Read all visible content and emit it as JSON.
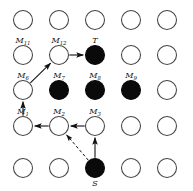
{
  "figure": {
    "width": 193,
    "height": 191,
    "background": "#ffffff",
    "node_stroke": "#444444",
    "filled_color": "#0a0a0a",
    "open_color": "#ffffff",
    "edge_color": "#111111"
  },
  "grid": {
    "columns": 5,
    "rows": 5,
    "col_x": [
      23,
      59,
      95,
      131,
      167
    ],
    "row_y": [
      20,
      55,
      90,
      126,
      168
    ],
    "radius": 9.5
  },
  "nodes": [
    {
      "id": "r1c1",
      "col": 0,
      "row": 0,
      "filled": false,
      "label": "",
      "sub": "",
      "label_pos": "none"
    },
    {
      "id": "r1c2",
      "col": 1,
      "row": 0,
      "filled": false,
      "label": "",
      "sub": "",
      "label_pos": "none"
    },
    {
      "id": "r1c3",
      "col": 2,
      "row": 0,
      "filled": false,
      "label": "",
      "sub": "",
      "label_pos": "none"
    },
    {
      "id": "r1c4",
      "col": 3,
      "row": 0,
      "filled": false,
      "label": "",
      "sub": "",
      "label_pos": "none"
    },
    {
      "id": "r1c5",
      "col": 4,
      "row": 0,
      "filled": false,
      "label": "",
      "sub": "",
      "label_pos": "none"
    },
    {
      "id": "M11",
      "col": 0,
      "row": 1,
      "filled": false,
      "label": "M",
      "sub": "11",
      "label_pos": "above"
    },
    {
      "id": "M12",
      "col": 1,
      "row": 1,
      "filled": false,
      "label": "M",
      "sub": "12",
      "label_pos": "above"
    },
    {
      "id": "T",
      "col": 2,
      "row": 1,
      "filled": true,
      "label": "T",
      "sub": "",
      "label_pos": "above"
    },
    {
      "id": "r2c4",
      "col": 3,
      "row": 1,
      "filled": false,
      "label": "",
      "sub": "",
      "label_pos": "none"
    },
    {
      "id": "r2c5",
      "col": 4,
      "row": 1,
      "filled": false,
      "label": "",
      "sub": "",
      "label_pos": "none"
    },
    {
      "id": "M6",
      "col": 0,
      "row": 2,
      "filled": false,
      "label": "M",
      "sub": "6",
      "label_pos": "above"
    },
    {
      "id": "M7",
      "col": 1,
      "row": 2,
      "filled": true,
      "label": "M",
      "sub": "7",
      "label_pos": "above"
    },
    {
      "id": "M8",
      "col": 2,
      "row": 2,
      "filled": true,
      "label": "M",
      "sub": "8",
      "label_pos": "above"
    },
    {
      "id": "M9",
      "col": 3,
      "row": 2,
      "filled": true,
      "label": "M",
      "sub": "9",
      "label_pos": "above"
    },
    {
      "id": "r3c5",
      "col": 4,
      "row": 2,
      "filled": false,
      "label": "",
      "sub": "",
      "label_pos": "none"
    },
    {
      "id": "M1",
      "col": 0,
      "row": 3,
      "filled": false,
      "label": "M",
      "sub": "1",
      "label_pos": "above"
    },
    {
      "id": "M2",
      "col": 1,
      "row": 3,
      "filled": false,
      "label": "M",
      "sub": "2",
      "label_pos": "above"
    },
    {
      "id": "M3",
      "col": 2,
      "row": 3,
      "filled": false,
      "label": "M",
      "sub": "3",
      "label_pos": "above"
    },
    {
      "id": "r4c4",
      "col": 3,
      "row": 3,
      "filled": false,
      "label": "",
      "sub": "",
      "label_pos": "none"
    },
    {
      "id": "r4c5",
      "col": 4,
      "row": 3,
      "filled": false,
      "label": "",
      "sub": "",
      "label_pos": "none"
    },
    {
      "id": "r5c1",
      "col": 0,
      "row": 4,
      "filled": false,
      "label": "",
      "sub": "",
      "label_pos": "none"
    },
    {
      "id": "r5c2",
      "col": 1,
      "row": 4,
      "filled": false,
      "label": "",
      "sub": "",
      "label_pos": "none"
    },
    {
      "id": "S",
      "col": 2,
      "row": 4,
      "filled": true,
      "label": "S",
      "sub": "",
      "label_pos": "below"
    },
    {
      "id": "r5c4",
      "col": 3,
      "row": 4,
      "filled": false,
      "label": "",
      "sub": "",
      "label_pos": "none"
    },
    {
      "id": "r5c5",
      "col": 4,
      "row": 4,
      "filled": false,
      "label": "",
      "sub": "",
      "label_pos": "none"
    }
  ],
  "edges": [
    {
      "id": "e-m12-t",
      "from": "M12",
      "to": "T",
      "style": "solid",
      "arrow": true
    },
    {
      "id": "e-m6-m12",
      "from": "M6",
      "to": "M12",
      "style": "solid",
      "arrow": true
    },
    {
      "id": "e-m1-m6",
      "from": "M1",
      "to": "M6",
      "style": "solid",
      "arrow": true
    },
    {
      "id": "e-m2-m1",
      "from": "M2",
      "to": "M1",
      "style": "solid",
      "arrow": true
    },
    {
      "id": "e-m3-m2",
      "from": "M3",
      "to": "M2",
      "style": "solid",
      "arrow": true
    },
    {
      "id": "e-s-m3",
      "from": "S",
      "to": "M3",
      "style": "solid",
      "arrow": true
    },
    {
      "id": "e-s-m2",
      "from": "S",
      "to": "M2",
      "style": "dashed",
      "arrow": true
    }
  ]
}
